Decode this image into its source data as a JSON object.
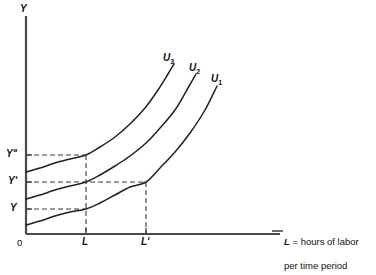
{
  "figure": {
    "caption_top_clipped": "",
    "axes": {
      "y_axis_name": "Y",
      "origin_label": "0",
      "x_axis_caption_line1_var": "L",
      "x_axis_caption_line1_rest": " = hours of labor",
      "x_axis_caption_line2": "per time period",
      "y_ticks": [
        {
          "id": "y-double-prime",
          "label": "Yʺ",
          "value_px": 155
        },
        {
          "id": "y-prime",
          "label": "Yʹ",
          "value_px": 182
        },
        {
          "id": "y",
          "label": "Y",
          "value_px": 209
        }
      ],
      "x_ticks": [
        {
          "id": "l",
          "label": "L",
          "value_px": 86
        },
        {
          "id": "l-prime",
          "label": "Lʹ",
          "value_px": 146
        }
      ]
    },
    "curves": [
      {
        "id": "u1",
        "label": "U",
        "subscript": "1"
      },
      {
        "id": "u2",
        "label": "U",
        "subscript": "2"
      },
      {
        "id": "u3",
        "label": "U",
        "subscript": "3"
      }
    ],
    "colors": {
      "ink": "#1a1a1a",
      "axis": "#4a4a4a",
      "curve": "#222222",
      "dashed": "#3a3a3a",
      "background": "#ffffff"
    }
  },
  "chart_data": {
    "type": "line",
    "title": "",
    "xlabel": "L = hours of labor per time period",
    "ylabel": "Y",
    "grid": false,
    "legend": "inline-curve-labels",
    "xlim": [
      0,
      1
    ],
    "ylim": [
      0,
      1
    ],
    "xtick_labels": [
      "0",
      "L",
      "Lʹ"
    ],
    "ytick_labels": [
      "Y",
      "Yʹ",
      "Yʺ"
    ],
    "annotations": [
      "Dashed guide from Yʺ meets U3 at labor L",
      "Dashed guide from Yʹ meets U2 at labor L and U1 at labor Lʹ",
      "Dashed guide from Y meets U1 at labor L"
    ],
    "series": [
      {
        "name": "U1",
        "points": [
          [
            26,
            225
          ],
          [
            40,
            221
          ],
          [
            55,
            216
          ],
          [
            70,
            212
          ],
          [
            86,
            209
          ],
          [
            100,
            203
          ],
          [
            115,
            195
          ],
          [
            130,
            187
          ],
          [
            146,
            182
          ],
          [
            160,
            168
          ],
          [
            175,
            152
          ],
          [
            190,
            133
          ],
          [
            205,
            110
          ],
          [
            217,
            86
          ]
        ]
      },
      {
        "name": "U2",
        "points": [
          [
            26,
            199
          ],
          [
            40,
            195
          ],
          [
            55,
            190
          ],
          [
            70,
            186
          ],
          [
            86,
            182
          ],
          [
            100,
            175
          ],
          [
            115,
            166
          ],
          [
            130,
            156
          ],
          [
            146,
            143
          ],
          [
            160,
            128
          ],
          [
            175,
            110
          ],
          [
            188,
            88
          ],
          [
            196,
            74
          ]
        ]
      },
      {
        "name": "U3",
        "points": [
          [
            26,
            172
          ],
          [
            40,
            168
          ],
          [
            55,
            163
          ],
          [
            70,
            159
          ],
          [
            86,
            155
          ],
          [
            100,
            147
          ],
          [
            115,
            137
          ],
          [
            130,
            124
          ],
          [
            145,
            108
          ],
          [
            158,
            90
          ],
          [
            168,
            74
          ],
          [
            174,
            64
          ]
        ]
      }
    ]
  }
}
